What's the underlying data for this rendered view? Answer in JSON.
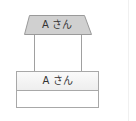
{
  "diagram": {
    "actor": {
      "label": "A さん",
      "shape": "trapezoid",
      "fill": "#d0d0d0",
      "stroke": "#9a9a9a"
    },
    "connector": {
      "stroke": "#a0a0a0"
    },
    "class_box": {
      "title": "A さん",
      "header_fill": "#f2f2f2",
      "stroke": "#a8a8a8",
      "body": ""
    }
  }
}
